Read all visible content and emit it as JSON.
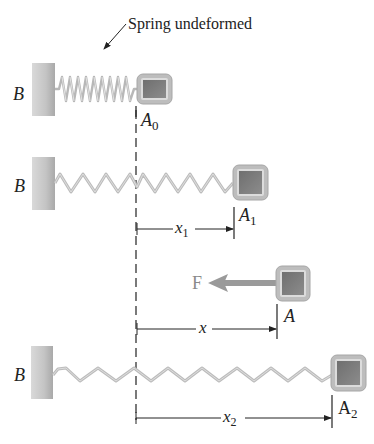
{
  "diagram": {
    "type": "spring-block-positions",
    "annotation": {
      "text": "Spring undeformed"
    },
    "wall_label": "B",
    "reference_line": "dashed vertical line at undeformed position A0",
    "states": [
      {
        "id": "state-0",
        "wall_label": "B",
        "block_label": "A",
        "block_subscript": "0",
        "spring": "compressed-coil (undeformed)"
      },
      {
        "id": "state-1",
        "wall_label": "B",
        "block_label": "A",
        "block_subscript": "1",
        "spring": "stretched-zigzag",
        "dimension": {
          "label": "x",
          "subscript": "1"
        }
      },
      {
        "id": "state-force",
        "block_label": "A",
        "block_subscript": "",
        "force_label": "F",
        "dimension": {
          "label": "x",
          "subscript": ""
        }
      },
      {
        "id": "state-2",
        "wall_label": "B",
        "block_label": "A",
        "block_subscript": "2",
        "spring": "stretched-zigzag (longer)",
        "dimension": {
          "label": "x",
          "subscript": "2"
        }
      }
    ],
    "colors": {
      "wall": "#c8c8c8",
      "block_outer": "#b5b5b5",
      "block_inner": "#7a7a7a",
      "spring": "#bdbdbd",
      "force_arrow": "#8e8e8e",
      "lines": "#222222"
    }
  }
}
